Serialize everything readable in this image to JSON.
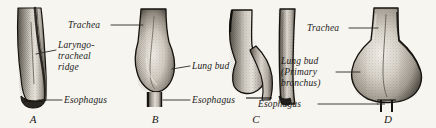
{
  "figure": {
    "background_color": "#f7f5f0",
    "ink_color": "#1a1a18",
    "caption_letters": [
      "A",
      "B",
      "C",
      "D"
    ]
  },
  "panels": [
    {
      "id": "A",
      "letter": "A",
      "labels": [
        {
          "name": "laryngotracheal-ridge",
          "lines": [
            "Laryngo-",
            "tracheal",
            "ridge"
          ]
        },
        {
          "name": "esophagus",
          "lines": [
            "Esophagus"
          ]
        }
      ]
    },
    {
      "id": "B",
      "letter": "B",
      "labels": [
        {
          "name": "trachea",
          "lines": [
            "Trachea"
          ]
        },
        {
          "name": "lung-bud",
          "lines": [
            "Lung  bud"
          ]
        },
        {
          "name": "esophagus",
          "lines": [
            "Esophagus"
          ]
        }
      ]
    },
    {
      "id": "C",
      "letter": "C",
      "labels": []
    },
    {
      "id": "D",
      "letter": "D",
      "labels": [
        {
          "name": "trachea",
          "lines": [
            "Trachea"
          ]
        },
        {
          "name": "lung-bud-primary-bronchus",
          "lines": [
            "Lung bud",
            "(Primary",
            "bronchus)"
          ]
        },
        {
          "name": "esophagus",
          "lines": [
            "Esophagus"
          ]
        }
      ]
    }
  ],
  "text": {
    "trachea_b": "Trachea",
    "laryngo_1": "Laryngo-",
    "laryngo_2": "tracheal",
    "laryngo_3": "ridge",
    "esophagus_a": "Esophagus",
    "lung_bud_b": "Lung  bud",
    "esophagus_b": "Esophagus",
    "trachea_d": "Trachea",
    "lung_bud_d_1": "Lung bud",
    "lung_bud_d_2": "(Primary",
    "lung_bud_d_3": "bronchus)",
    "esophagus_d": "Esophagus",
    "letter_a": "A",
    "letter_b": "B",
    "letter_c": "C",
    "letter_d": "D"
  }
}
